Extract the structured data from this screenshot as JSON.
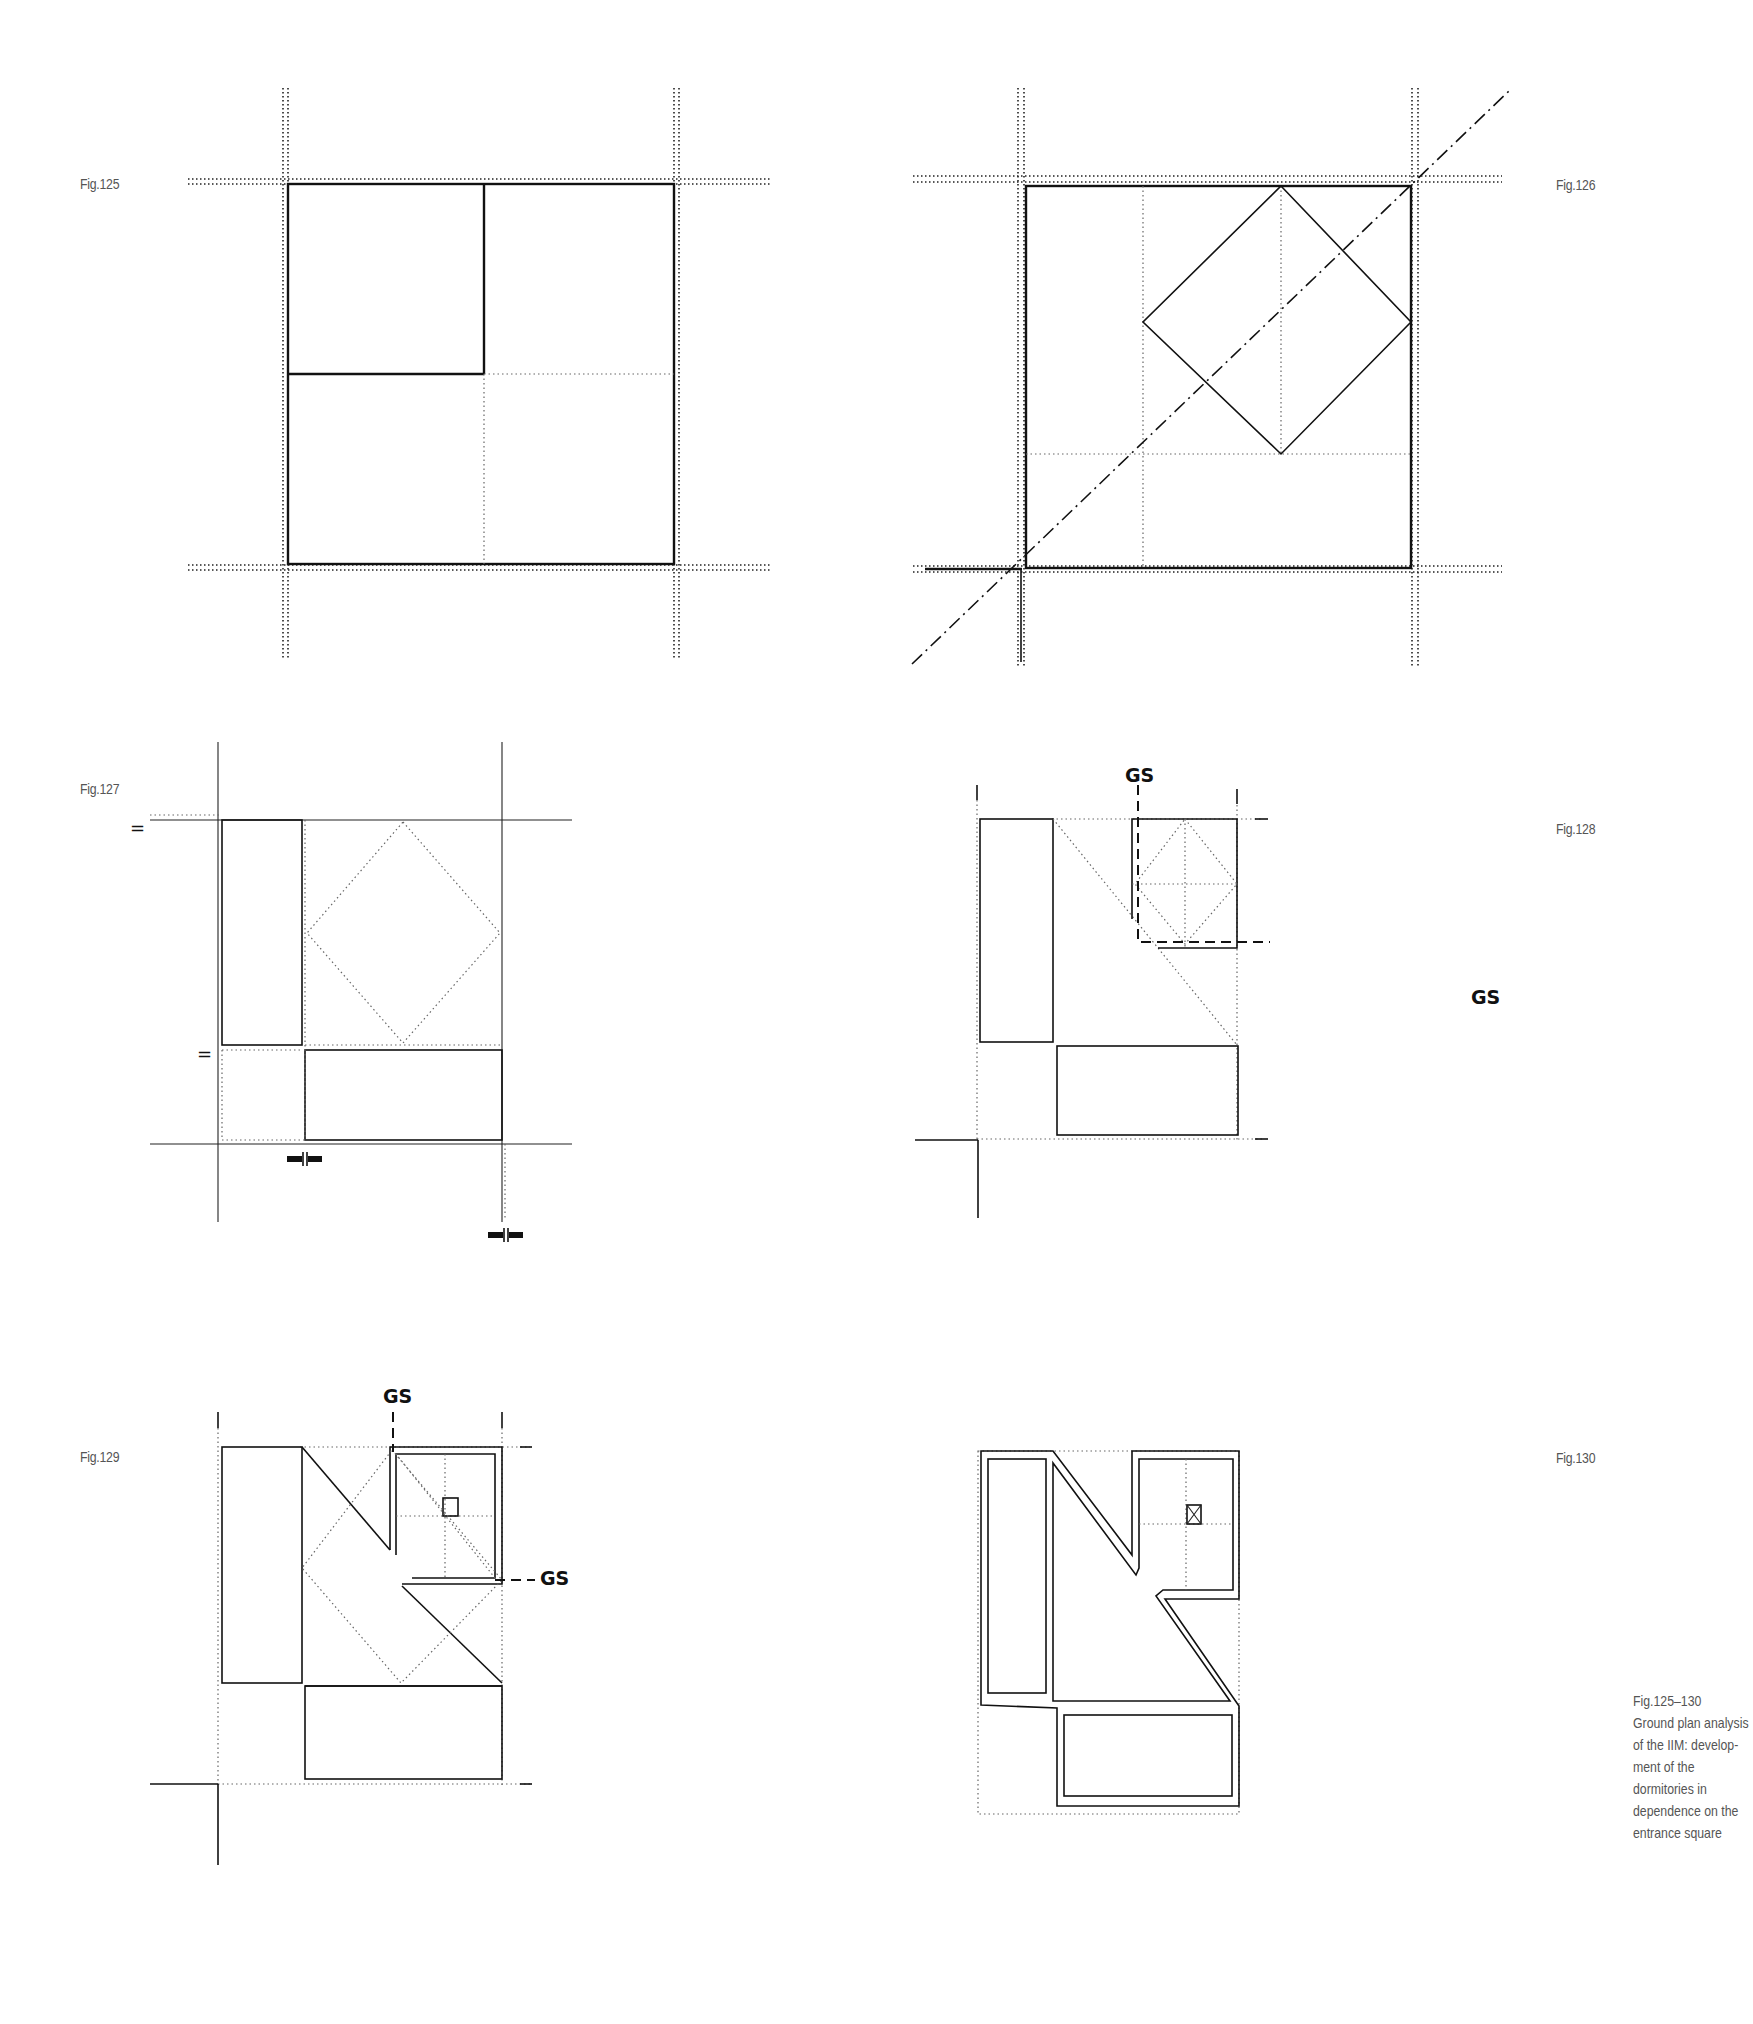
{
  "page": {
    "type": "architectural ground plan analysis figure plate",
    "figures": [
      {
        "id": "fig125",
        "label": "Fig.125"
      },
      {
        "id": "fig126",
        "label": "Fig.126"
      },
      {
        "id": "fig127",
        "label": "Fig.127",
        "annotations": {
          "equal_top": "=",
          "equal_mid": "="
        }
      },
      {
        "id": "fig128",
        "label": "Fig.128",
        "annotations": {
          "gs_top": "GS",
          "gs_right": "GS"
        }
      },
      {
        "id": "fig129",
        "label": "Fig.129",
        "annotations": {
          "gs_top": "GS",
          "gs_right": "GS"
        }
      },
      {
        "id": "fig130",
        "label": "Fig.130"
      }
    ],
    "caption": {
      "lines": [
        "Fig.125–130",
        "Ground plan analysis",
        "of the IIM: develop-",
        "ment of the",
        "dormitories in",
        "dependence on the",
        "entrance square"
      ]
    }
  }
}
